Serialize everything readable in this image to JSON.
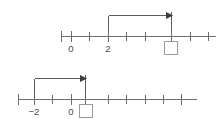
{
  "page": {
    "background_color": "#ffffff",
    "line_color": "#6e6e6e",
    "label_color": "#4a4a4a",
    "arrow_color": "#3c3c3c",
    "box_border_color": "#9a9a9a"
  },
  "diagrams": [
    {
      "name": "top-number-line",
      "axis": {
        "y": 36,
        "x_start": 61,
        "x_end": 216,
        "unit_px": 18.5,
        "origin_x": 71,
        "tick_positions_px": [
          61,
          71,
          89,
          108,
          126,
          145,
          163,
          171,
          190,
          208
        ],
        "tick_values": [
          0,
          1,
          2,
          3,
          4,
          5,
          6,
          7
        ],
        "tick_count": 10
      },
      "labels": [
        {
          "name": "tick-label-0",
          "text": "0",
          "x": 71,
          "y": 49
        },
        {
          "name": "tick-label-2",
          "text": "2",
          "x": 108,
          "y": 49
        }
      ],
      "answer_box": {
        "name": "answer-box-top",
        "x": 164,
        "y": 40,
        "size": 13,
        "value": ""
      },
      "jump_arrow": {
        "name": "jump-arrow-top",
        "start_x": 108,
        "end_x": 171,
        "y": 15,
        "start_value": 2,
        "stem_bottom_y": 36,
        "end_stem_bottom_y": 36,
        "direction": "right"
      }
    },
    {
      "name": "bottom-number-line",
      "axis": {
        "y": 99,
        "x_start": 18,
        "x_end": 197,
        "unit_px": 18.5,
        "origin_x": 71,
        "tick_positions_px": [
          18,
          34,
          52,
          71,
          85,
          108,
          126,
          145,
          163,
          181
        ],
        "tick_values": [
          -3,
          -2,
          -1,
          0,
          1,
          2,
          3,
          4
        ],
        "tick_count": 10
      },
      "labels": [
        {
          "name": "tick-label-minus-2",
          "text": "−2",
          "x": 34,
          "y": 112
        },
        {
          "name": "tick-label-0",
          "text": "0",
          "x": 71,
          "y": 112
        }
      ],
      "answer_box": {
        "name": "answer-box-bottom",
        "x": 79,
        "y": 103,
        "size": 13,
        "value": ""
      },
      "jump_arrow": {
        "name": "jump-arrow-bottom",
        "start_x": 34,
        "end_x": 85,
        "y": 78,
        "start_value": -2,
        "stem_bottom_y": 99,
        "end_stem_bottom_y": 99,
        "direction": "right"
      }
    }
  ]
}
